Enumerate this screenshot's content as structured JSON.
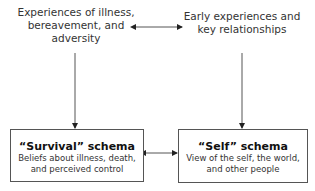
{
  "diagram": {
    "nodes": {
      "illness_experiences": {
        "lines": [
          "Experiences of illness,",
          "bereavement, and",
          "adversity"
        ]
      },
      "early_experiences": {
        "lines": [
          "Early experiences and",
          "key relationships"
        ]
      },
      "survival_schema": {
        "title": "“Survival” schema",
        "desc_lines": [
          "Beliefs about illness, death,",
          "and perceived control"
        ]
      },
      "self_schema": {
        "title": "“Self” schema",
        "desc_lines": [
          "View of the self, the world,",
          "and other people"
        ]
      }
    },
    "edges": [
      {
        "from": "illness_experiences",
        "to": "early_experiences",
        "type": "bidirectional"
      },
      {
        "from": "illness_experiences",
        "to": "survival_schema",
        "type": "directed"
      },
      {
        "from": "early_experiences",
        "to": "self_schema",
        "type": "directed"
      },
      {
        "from": "survival_schema",
        "to": "self_schema",
        "type": "bidirectional"
      }
    ],
    "colors": {
      "line": "#555555",
      "box_border": "#555555",
      "text": "#333333"
    }
  }
}
